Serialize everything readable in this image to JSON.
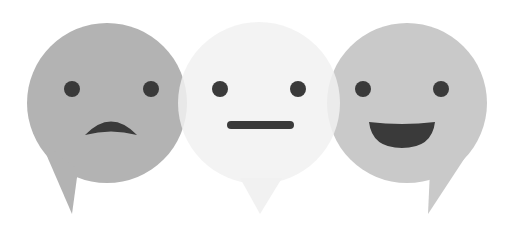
{
  "illustration": {
    "description": "Three overlapping speech-bubble emoji faces",
    "faces": [
      {
        "name": "sad",
        "expression": "frown",
        "fill": "#b3b3b3",
        "feature_color": "#3a3a3a"
      },
      {
        "name": "neutral",
        "expression": "straight",
        "fill": "#f1f1f1",
        "feature_color": "#3a3a3a"
      },
      {
        "name": "happy",
        "expression": "smile",
        "fill": "#c9c9c9",
        "feature_color": "#3a3a3a"
      }
    ],
    "overlap_color_left": "#d2d2d2",
    "overlap_color_right": "#e0e0e0",
    "background": "#ffffff"
  }
}
